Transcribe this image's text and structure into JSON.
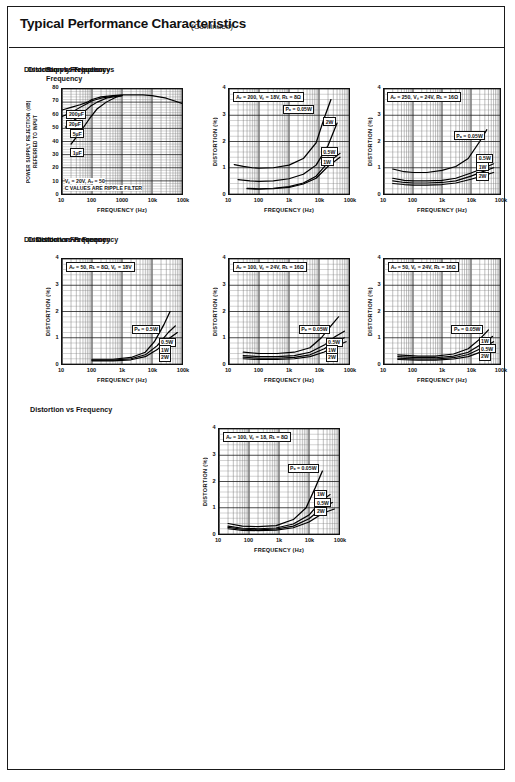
{
  "header": {
    "title": "Typical Performance Characteristics",
    "continued": "(Continued)"
  },
  "charts": [
    {
      "id": "supply-rejection-vs-frequency",
      "title": "Supply Rejection vs\nFrequency",
      "xlabel": "FREQUENCY (Hz)",
      "ylabel": "POWER SUPPLY REJECTION (dB)\nREFERRED TO INPUT",
      "xticks": [
        "10",
        "100",
        "1000",
        "10k",
        "100k"
      ],
      "yticks": [
        "80",
        "70",
        "60",
        "50",
        "40",
        "30",
        "20",
        "10",
        "0"
      ],
      "conditions": [
        "Vₛ = 20V, Aᵥ = 50",
        "C VALUES ARE RIPPLE FILTER"
      ],
      "curve_labels": [
        "200µF",
        "20µF",
        "5µF",
        "1µF"
      ],
      "chart_data": {
        "type": "line",
        "title": "Supply Rejection vs Frequency",
        "xlabel": "FREQUENCY (Hz)",
        "ylabel": "POWER SUPPLY REJECTION (dB) REFERRED TO INPUT",
        "xscale": "log",
        "xlim": [
          10,
          100000
        ],
        "ylim": [
          0,
          80
        ],
        "grid": true,
        "series": [
          {
            "name": "200µF",
            "x": [
              10,
              20,
              40,
              70,
              100,
              200,
              500,
              1000,
              5000,
              10000,
              30000,
              100000
            ],
            "y": [
              64,
              66,
              68,
              70,
              72,
              74,
              75,
              75.5,
              75.5,
              75,
              73,
              69
            ]
          },
          {
            "name": "20µF",
            "x": [
              10,
              20,
              40,
              70,
              100,
              200,
              500,
              1000
            ],
            "y": [
              59,
              62,
              66,
              69,
              71,
              73,
              74.5,
              75
            ]
          },
          {
            "name": "5µF",
            "x": [
              13,
              25,
              50,
              90,
              150,
              300,
              700,
              1000
            ],
            "y": [
              51,
              56,
              62,
              67,
              70,
              73,
              74.5,
              75
            ]
          },
          {
            "name": "1µF",
            "x": [
              20,
              40,
              80,
              150,
              300,
              600,
              1000
            ],
            "y": [
              38,
              47,
              57,
              65,
              70,
              73.5,
              75
            ]
          }
        ]
      }
    },
    {
      "id": "distortion-av200-vs18-rl8",
      "title": "Distortion vs Frequency",
      "xlabel": "FREQUENCY (Hz)",
      "ylabel": "DISTORTION (%)",
      "xticks": [
        "10",
        "100",
        "1k",
        "10k",
        "100k"
      ],
      "yticks": [
        "4",
        "3",
        "2",
        "1",
        "0"
      ],
      "conditions": [
        "Aᵥ = 200, Vₛ = 18V, Rʟ = 8Ω"
      ],
      "curve_labels": [
        "Pₒ = 0.05W",
        "2W",
        "0.5W",
        "1W"
      ],
      "chart_data": {
        "type": "line",
        "title": "Distortion vs Frequency",
        "xlabel": "FREQUENCY (Hz)",
        "ylabel": "DISTORTION (%)",
        "xscale": "log",
        "xlim": [
          10,
          100000
        ],
        "ylim": [
          0,
          4
        ],
        "grid": true,
        "series": [
          {
            "name": "0.05W",
            "x": [
              15,
              30,
              60,
              100,
              300,
              1000,
              3000,
              8000,
              15000,
              25000
            ],
            "y": [
              1.12,
              1.05,
              1.0,
              0.98,
              1.0,
              1.1,
              1.35,
              1.95,
              2.9,
              3.6
            ]
          },
          {
            "name": "2W",
            "x": [
              20,
              50,
              100,
              300,
              1000,
              3000,
              8000,
              20000,
              40000
            ],
            "y": [
              0.55,
              0.5,
              0.48,
              0.5,
              0.58,
              0.75,
              1.1,
              1.85,
              2.7
            ]
          },
          {
            "name": "0.5W",
            "x": [
              40,
              100,
              300,
              1000,
              3000,
              8000,
              20000,
              50000
            ],
            "y": [
              0.22,
              0.2,
              0.22,
              0.28,
              0.42,
              0.68,
              1.2,
              1.55
            ]
          },
          {
            "name": "1W",
            "x": [
              40,
              100,
              300,
              1000,
              3000,
              8000,
              20000,
              50000
            ],
            "y": [
              0.2,
              0.18,
              0.2,
              0.25,
              0.38,
              0.6,
              1.05,
              1.4
            ]
          }
        ]
      }
    },
    {
      "id": "distortion-av250-vs24-rl16",
      "title": "Distortion vs Frequency",
      "xlabel": "FREQUENCY (Hz)",
      "ylabel": "DISTORTION (%)",
      "xticks": [
        "10",
        "100",
        "1k",
        "10k",
        "100k"
      ],
      "yticks": [
        "4",
        "3",
        "2",
        "1",
        "0"
      ],
      "conditions": [
        "Aᵥ = 250, Vₛ = 24V, Rʟ = 16Ω"
      ],
      "curve_labels": [
        "Pₒ = 0.05W",
        "0.5W",
        "1W",
        "2W"
      ],
      "chart_data": {
        "type": "line",
        "title": "Distortion vs Frequency",
        "xlabel": "FREQUENCY (Hz)",
        "ylabel": "DISTORTION (%)",
        "xscale": "log",
        "xlim": [
          10,
          100000
        ],
        "ylim": [
          0,
          4
        ],
        "grid": true,
        "series": [
          {
            "name": "0.05W",
            "x": [
              20,
              50,
              100,
              300,
              1000,
              3000,
              8000,
              20000,
              35000
            ],
            "y": [
              0.95,
              0.85,
              0.82,
              0.82,
              0.9,
              1.05,
              1.35,
              2.0,
              2.45
            ]
          },
          {
            "name": "0.5W",
            "x": [
              20,
              50,
              100,
              300,
              1000,
              3000,
              10000,
              30000,
              60000
            ],
            "y": [
              0.6,
              0.52,
              0.5,
              0.5,
              0.52,
              0.6,
              0.8,
              1.0,
              1.15
            ]
          },
          {
            "name": "1W",
            "x": [
              20,
              50,
              100,
              300,
              1000,
              3000,
              10000,
              30000,
              60000
            ],
            "y": [
              0.5,
              0.44,
              0.42,
              0.42,
              0.44,
              0.5,
              0.68,
              0.88,
              1.0
            ]
          },
          {
            "name": "2W",
            "x": [
              20,
              50,
              100,
              300,
              1000,
              3000,
              10000,
              30000,
              60000
            ],
            "y": [
              0.4,
              0.36,
              0.34,
              0.34,
              0.36,
              0.42,
              0.56,
              0.72,
              0.82
            ]
          }
        ]
      }
    },
    {
      "id": "distortion-av50-rl8-vs18",
      "title": "Distortion vs Frequency",
      "xlabel": "FREQUENCY (Hz)",
      "ylabel": "DISTORTION (%)",
      "xticks": [
        "10",
        "100",
        "1k",
        "10k",
        "100k"
      ],
      "yticks": [
        "4",
        "3",
        "2",
        "1",
        "0"
      ],
      "conditions": [
        "Aᵥ = 50, Rʟ = 8Ω, Vₛ = 18V"
      ],
      "curve_labels": [
        "Pₒ = 0.5W",
        "0.5W",
        "1W",
        "2W"
      ],
      "chart_data": {
        "type": "line",
        "title": "Distortion vs Frequency",
        "xlabel": "FREQUENCY (Hz)",
        "ylabel": "DISTORTION (%)",
        "xscale": "log",
        "xlim": [
          10,
          100000
        ],
        "ylim": [
          0,
          4
        ],
        "grid": true,
        "series": [
          {
            "name": "0.5W",
            "x": [
              100,
              500,
              2000,
              6000,
              12000,
              25000,
              40000
            ],
            "y": [
              0.18,
              0.18,
              0.25,
              0.45,
              0.85,
              1.5,
              2.0
            ]
          },
          {
            "name": "1W",
            "x": [
              100,
              500,
              2000,
              6000,
              15000,
              35000,
              60000
            ],
            "y": [
              0.15,
              0.15,
              0.2,
              0.35,
              0.7,
              1.2,
              1.45
            ]
          },
          {
            "name": "2W",
            "x": [
              100,
              500,
              2000,
              6000,
              15000,
              35000,
              70000
            ],
            "y": [
              0.12,
              0.12,
              0.16,
              0.28,
              0.55,
              0.95,
              1.2
            ]
          }
        ]
      }
    },
    {
      "id": "distortion-av100-vs24-rl16",
      "title": "Distortion vs Frequency",
      "xlabel": "FREQUENCY (Hz)",
      "ylabel": "DISTORTION (%)",
      "xticks": [
        "10",
        "100",
        "1k",
        "10k",
        "100k"
      ],
      "yticks": [
        "4",
        "3",
        "2",
        "1",
        "0"
      ],
      "conditions": [
        "Aᵥ = 100, Vₛ = 24V, Rʟ = 16Ω"
      ],
      "curve_labels": [
        "Pₒ = 0.05W",
        "0.5W",
        "1W",
        "2W"
      ],
      "chart_data": {
        "type": "line",
        "title": "Distortion vs Frequency",
        "xlabel": "FREQUENCY (Hz)",
        "ylabel": "DISTORTION (%)",
        "xscale": "log",
        "xlim": [
          10,
          100000
        ],
        "ylim": [
          0,
          4
        ],
        "grid": true,
        "series": [
          {
            "name": "0.05W",
            "x": [
              30,
              100,
              400,
              1500,
              5000,
              12000,
              25000,
              45000
            ],
            "y": [
              0.45,
              0.4,
              0.4,
              0.45,
              0.62,
              1.0,
              1.45,
              1.8
            ]
          },
          {
            "name": "0.5W",
            "x": [
              30,
              100,
              400,
              1500,
              5000,
              15000,
              35000,
              70000
            ],
            "y": [
              0.32,
              0.28,
              0.28,
              0.32,
              0.45,
              0.72,
              1.05,
              1.25
            ]
          },
          {
            "name": "1W",
            "x": [
              30,
              100,
              400,
              1500,
              5000,
              15000,
              35000,
              70000
            ],
            "y": [
              0.26,
              0.22,
              0.22,
              0.25,
              0.35,
              0.58,
              0.85,
              1.0
            ]
          },
          {
            "name": "2W",
            "x": [
              30,
              100,
              400,
              1500,
              5000,
              15000,
              35000,
              80000
            ],
            "y": [
              0.2,
              0.17,
              0.17,
              0.2,
              0.28,
              0.46,
              0.68,
              0.85
            ]
          }
        ]
      }
    },
    {
      "id": "distortion-av50-vs24-rl16",
      "title": "Distortion vs Frequency",
      "xlabel": "FREQUENCY (Hz)",
      "ylabel": "DISTORTION (%)",
      "xticks": [
        "10",
        "100",
        "1k",
        "10k",
        "100k"
      ],
      "yticks": [
        "4",
        "3",
        "2",
        "1",
        "0"
      ],
      "conditions": [
        "Aᵥ = 50, Vₛ = 24V, Rʟ = 16Ω"
      ],
      "curve_labels": [
        "Pₒ = 0.05W",
        "1W",
        "0.5W",
        "2W"
      ],
      "chart_data": {
        "type": "line",
        "title": "Distortion vs Frequency",
        "xlabel": "FREQUENCY (Hz)",
        "ylabel": "DISTORTION (%)",
        "xscale": "log",
        "xlim": [
          10,
          100000
        ],
        "ylim": [
          0,
          4
        ],
        "grid": true,
        "series": [
          {
            "name": "0.05W",
            "x": [
              30,
              150,
              600,
              2500,
              8000,
              20000,
              40000
            ],
            "y": [
              0.35,
              0.3,
              0.3,
              0.38,
              0.58,
              0.95,
              1.3
            ]
          },
          {
            "name": "1W",
            "x": [
              30,
              150,
              600,
              2500,
              8000,
              25000,
              55000
            ],
            "y": [
              0.28,
              0.24,
              0.24,
              0.3,
              0.45,
              0.78,
              1.05
            ]
          },
          {
            "name": "0.5W",
            "x": [
              30,
              150,
              600,
              2500,
              8000,
              25000,
              60000
            ],
            "y": [
              0.22,
              0.19,
              0.19,
              0.24,
              0.36,
              0.62,
              0.85
            ]
          },
          {
            "name": "2W",
            "x": [
              30,
              150,
              600,
              2500,
              8000,
              25000,
              70000
            ],
            "y": [
              0.17,
              0.15,
              0.15,
              0.19,
              0.28,
              0.48,
              0.68
            ]
          }
        ]
      }
    },
    {
      "id": "distortion-av100-vs18-rl8",
      "title": "Distortion vs Frequency",
      "xlabel": "FREQUENCY (Hz)",
      "ylabel": "DISTORTION (%)",
      "xticks": [
        "10",
        "100",
        "1k",
        "10k",
        "100k"
      ],
      "yticks": [
        "4",
        "3",
        "2",
        "1",
        "0"
      ],
      "conditions": [
        "Aᵥ = 100, Vₛ = 18, Rʟ = 8Ω"
      ],
      "curve_labels": [
        "Pₒ = 0.05W",
        "1W",
        "0.5W",
        "2W"
      ],
      "chart_data": {
        "type": "line",
        "title": "Distortion vs Frequency",
        "xlabel": "FREQUENCY (Hz)",
        "ylabel": "DISTORTION (%)",
        "xscale": "log",
        "xlim": [
          10,
          100000
        ],
        "ylim": [
          0,
          4
        ],
        "grid": true,
        "series": [
          {
            "name": "0.05W",
            "x": [
              20,
              60,
              200,
              800,
              3000,
              8000,
              16000,
              28000
            ],
            "y": [
              0.4,
              0.3,
              0.28,
              0.32,
              0.55,
              1.0,
              1.75,
              2.4
            ]
          },
          {
            "name": "1W",
            "x": [
              20,
              60,
              200,
              800,
              3000,
              10000,
              25000,
              50000
            ],
            "y": [
              0.3,
              0.22,
              0.2,
              0.23,
              0.38,
              0.72,
              1.25,
              1.5
            ]
          },
          {
            "name": "0.5W",
            "x": [
              20,
              60,
              200,
              800,
              3000,
              10000,
              28000,
              60000
            ],
            "y": [
              0.25,
              0.18,
              0.16,
              0.19,
              0.3,
              0.58,
              1.0,
              1.2
            ]
          },
          {
            "name": "2W",
            "x": [
              20,
              60,
              200,
              800,
              3000,
              10000,
              30000,
              70000
            ],
            "y": [
              0.2,
              0.14,
              0.13,
              0.15,
              0.24,
              0.46,
              0.8,
              0.95
            ]
          }
        ]
      }
    }
  ]
}
